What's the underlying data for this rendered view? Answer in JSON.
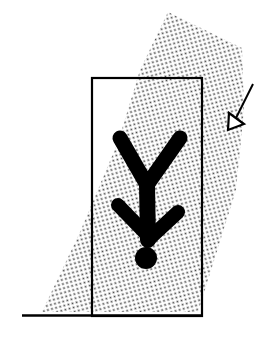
{
  "figure": {
    "colors": {
      "ink": "#000000",
      "background": "#ffffff",
      "stipple": "#555555"
    },
    "elements": {
      "stipple_band": "stippled-diagonal-band",
      "frame": "door-frame-rectangle",
      "ground": "ground-line",
      "person": "inverted-person-figure",
      "arrow": "incoming-arrow"
    }
  }
}
